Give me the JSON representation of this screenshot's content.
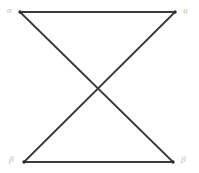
{
  "figure": {
    "type": "bowtie-graph",
    "background_color": "#ffffff",
    "edge_color": "#3a3a3a",
    "label_color": "#b9b9b9",
    "vertex_marker_color": "#2e2e2e"
  },
  "vertices": [
    {
      "id": "top-left",
      "label": "α",
      "x": 20,
      "y": 12
    },
    {
      "id": "top-right",
      "label": "u",
      "x": 175,
      "y": 12
    },
    {
      "id": "bottom-left",
      "label": "β",
      "x": 24,
      "y": 162
    },
    {
      "id": "bottom-right",
      "label": "β",
      "x": 173,
      "y": 162
    }
  ],
  "edges": [
    {
      "id": "edge-top",
      "from": "top-left",
      "to": "top-right"
    },
    {
      "id": "edge-bottom",
      "from": "bottom-left",
      "to": "bottom-right"
    },
    {
      "id": "edge-diagonal-down",
      "from": "top-left",
      "to": "bottom-right"
    },
    {
      "id": "edge-diagonal-up",
      "from": "bottom-left",
      "to": "top-right"
    }
  ],
  "crossing_point": {
    "x": 98,
    "y": 87
  }
}
